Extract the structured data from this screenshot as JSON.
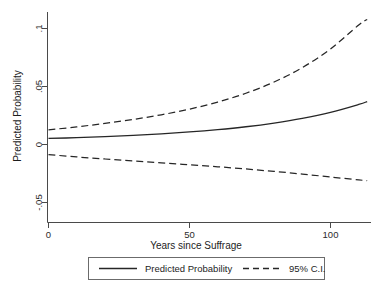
{
  "chart_data": {
    "type": "line",
    "title": "",
    "subtitle": "",
    "xlabel": "Years since Suffrage",
    "ylabel": "Predicted Probability",
    "xlim": [
      -4,
      118
    ],
    "ylim": [
      -0.062,
      0.118
    ],
    "grid": false,
    "legend_position": "bottom",
    "x_ticks": [
      0,
      50,
      100
    ],
    "x_tick_labels": [
      "0",
      "50",
      "100"
    ],
    "y_ticks": [
      -0.05,
      0,
      0.05,
      0.1
    ],
    "y_tick_labels": [
      "-.05",
      "0",
      ".05",
      ".1"
    ],
    "x": [
      0,
      10,
      20,
      30,
      40,
      50,
      60,
      70,
      80,
      90,
      100,
      110,
      113
    ],
    "series": [
      {
        "name": "Predicted Probability",
        "style": "solid",
        "color": "#262626",
        "values": [
          0.0052,
          0.0059,
          0.0068,
          0.0079,
          0.0092,
          0.0108,
          0.0128,
          0.0153,
          0.0185,
          0.0225,
          0.0277,
          0.0345,
          0.037
        ]
      },
      {
        "name": "95% C.I. upper",
        "style": "dashed",
        "color": "#262626",
        "values": [
          0.0126,
          0.0152,
          0.0182,
          0.0216,
          0.0256,
          0.0305,
          0.0366,
          0.0442,
          0.0539,
          0.0663,
          0.0824,
          0.103,
          0.1078
        ]
      },
      {
        "name": "95% C.I. lower",
        "style": "dashed",
        "color": "#262626",
        "values": [
          -0.0087,
          -0.0107,
          -0.0125,
          -0.0142,
          -0.0158,
          -0.0175,
          -0.0192,
          -0.0211,
          -0.0232,
          -0.0255,
          -0.028,
          -0.0305,
          -0.0312
        ]
      }
    ],
    "legend_entries": [
      {
        "label": "Predicted Probability",
        "style": "solid"
      },
      {
        "label": "95% C.I.",
        "style": "dashed"
      }
    ]
  },
  "axes": {
    "y_title": "Predicted Probability",
    "x_title": "Years since Suffrage",
    "y_tick_0": ".1",
    "y_tick_1": ".05",
    "y_tick_2": "0",
    "y_tick_3": "-.05",
    "x_tick_0": "0",
    "x_tick_1": "50",
    "x_tick_2": "100"
  },
  "legend": {
    "entry_1_label": "Predicted Probability",
    "entry_2_label": "95% C.I."
  }
}
